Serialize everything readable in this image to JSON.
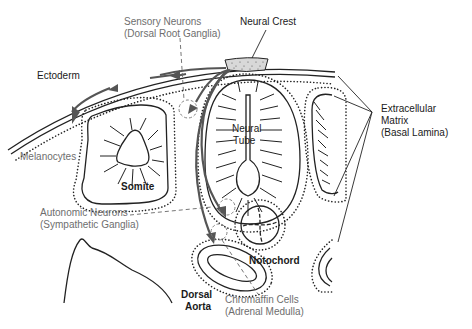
{
  "labels": {
    "sensory_neurons": [
      "Sensory Neurons",
      "(Dorsal Root Ganglia)"
    ],
    "neural_crest": "Neural Crest",
    "ectoderm": "Ectoderm",
    "extracellular_matrix": [
      "Extracellular",
      "Matrix",
      "(Basal Lamina)"
    ],
    "neural_tube": [
      "Neural",
      "Tube"
    ],
    "melanocytes": "Melanocytes",
    "somite": "Somite",
    "autonomic_neurons": [
      "Autonomic Neurons",
      "(Sympathetic Ganglia)"
    ],
    "notochord": "Notochord",
    "dorsal_aorta": [
      "Dorsal",
      "Aorta"
    ],
    "chromaffin_cells": [
      "Chromaffin Cells",
      "(Adrenal Medulla)"
    ]
  },
  "colors": {
    "structure_line": "#222222",
    "migration_arrow": "#555555",
    "derivative_label": "#6e6e6e",
    "structure_label": "#1a1a1a"
  }
}
